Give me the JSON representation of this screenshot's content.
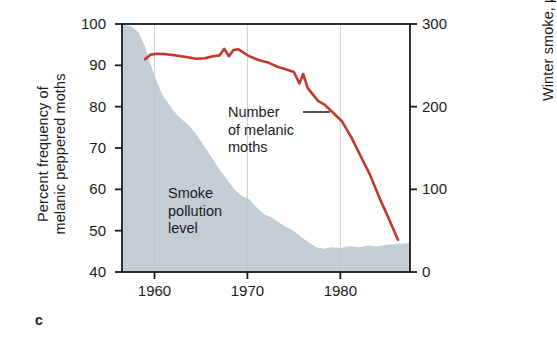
{
  "panel": {
    "label": "c"
  },
  "axes": {
    "left": {
      "title_line1": "Percent frequency of",
      "title_line2": "melanic peppered moths",
      "ticks": [
        100,
        90,
        80,
        70,
        60,
        50,
        40
      ],
      "min": 40,
      "max": 100
    },
    "right": {
      "title": "Winter smoke, µg/m³",
      "ticks": [
        300,
        200,
        100,
        0
      ],
      "min": 0,
      "max": 300
    },
    "bottom": {
      "ticks": [
        1960,
        1970,
        1980
      ],
      "min": 1956.5,
      "max": 1987.5
    }
  },
  "annotations": {
    "smoke": {
      "line1": "Smoke",
      "line2": "pollution",
      "line3": "level"
    },
    "moths": {
      "line1": "Number",
      "line2": "of melanic",
      "line3": "moths",
      "leader": "—"
    }
  },
  "colors": {
    "moth_line": "#c0392b",
    "smoke_fill": "#c3cdd6",
    "axis": "#1b1b1b",
    "gridline": "#b9c4cf",
    "background": "#ffffff"
  },
  "chart_data": {
    "type": "line",
    "title": "",
    "xlabel": "",
    "ylabel": "Percent frequency of melanic peppered moths",
    "y2label": "Winter smoke, µg/m³",
    "xlim": [
      1956.5,
      1987.5
    ],
    "ylim": [
      40,
      100
    ],
    "y2lim": [
      0,
      300
    ],
    "grid": "vertical-only",
    "legend": "none",
    "series": [
      {
        "name": "Number of melanic moths",
        "axis": "left",
        "type": "line",
        "color": "#c0392b",
        "unit": "percent",
        "x": [
          1959.0,
          1959.6,
          1960.3,
          1961.2,
          1962.3,
          1963.4,
          1964.5,
          1965.4,
          1966.3,
          1967.0,
          1967.5,
          1968.0,
          1968.5,
          1969.0,
          1969.5,
          1970.2,
          1971.2,
          1972.3,
          1973.3,
          1974.2,
          1975.0,
          1975.6,
          1976.0,
          1976.5,
          1977.0,
          1977.6,
          1978.3,
          1979.2,
          1980.2,
          1981.2,
          1982.2,
          1983.2,
          1984.2,
          1985.2,
          1986.2
        ],
        "y": [
          91.5,
          92.6,
          92.8,
          92.7,
          92.4,
          92.0,
          91.6,
          91.7,
          92.2,
          92.4,
          94.0,
          92.2,
          93.7,
          93.9,
          93.2,
          92.2,
          91.3,
          90.6,
          89.6,
          89.0,
          88.4,
          85.6,
          87.9,
          84.5,
          83.1,
          81.4,
          80.5,
          78.6,
          76.4,
          72.5,
          68.0,
          63.5,
          58.0,
          53.0,
          47.8
        ]
      },
      {
        "name": "Smoke pollution level",
        "axis": "right",
        "type": "area",
        "color": "#c3cdd6",
        "unit": "µg/m³",
        "x": [
          1956.5,
          1957.5,
          1958.3,
          1959.0,
          1959.6,
          1960.2,
          1960.8,
          1961.4,
          1962.0,
          1962.6,
          1963.2,
          1963.8,
          1964.4,
          1965.0,
          1965.6,
          1966.2,
          1967.0,
          1967.8,
          1968.6,
          1969.4,
          1970.2,
          1971.0,
          1971.8,
          1972.6,
          1973.4,
          1974.2,
          1975.0,
          1975.8,
          1976.6,
          1977.4,
          1978.2,
          1979.0,
          1980.0,
          1981.0,
          1982.0,
          1983.0,
          1984.0,
          1985.0,
          1986.0,
          1987.5
        ],
        "y": [
          300,
          297,
          290,
          272,
          250,
          232,
          215,
          205,
          196,
          188,
          182,
          176,
          168,
          158,
          148,
          138,
          124,
          112,
          100,
          92,
          88,
          78,
          70,
          66,
          60,
          54,
          50,
          42,
          36,
          30,
          28,
          30,
          29,
          31,
          30,
          32,
          31,
          33,
          34,
          35
        ]
      }
    ]
  }
}
